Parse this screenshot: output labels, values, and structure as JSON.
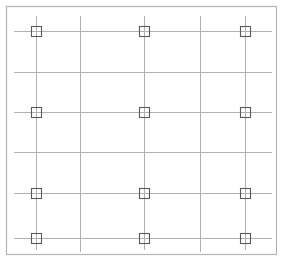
{
  "drawing": {
    "title": "Structural Column Grid Plan",
    "width": 283,
    "height": 264,
    "background_color": "#ffffff",
    "frame": {
      "name": "outer-frame",
      "x": 6,
      "y": 6,
      "width": 270,
      "height": 248,
      "stroke_color": "#b4b4b4",
      "stroke_width": 1.2
    },
    "grid": {
      "line_color": "#b0b0b0",
      "line_width": 1,
      "vertical_lines": [
        {
          "id": "grid-line-A",
          "x": 36,
          "y1": 16,
          "y2": 250,
          "has_markers": true
        },
        {
          "id": "grid-line-B",
          "x": 80,
          "y1": 16,
          "y2": 252,
          "has_markers": false
        },
        {
          "id": "grid-line-C",
          "x": 144,
          "y1": 16,
          "y2": 250,
          "has_markers": true
        },
        {
          "id": "grid-line-D",
          "x": 200,
          "y1": 16,
          "y2": 252,
          "has_markers": false
        },
        {
          "id": "grid-line-E",
          "x": 245,
          "y1": 16,
          "y2": 250,
          "has_markers": true
        }
      ],
      "horizontal_lines": [
        {
          "id": "grid-line-1",
          "y": 31,
          "x1": 14,
          "x2": 272,
          "has_markers": true
        },
        {
          "id": "grid-line-2",
          "y": 72,
          "x1": 14,
          "x2": 272,
          "has_markers": false
        },
        {
          "id": "grid-line-3",
          "y": 112,
          "x1": 14,
          "x2": 272,
          "has_markers": true
        },
        {
          "id": "grid-line-4",
          "y": 152,
          "x1": 14,
          "x2": 272,
          "has_markers": false
        },
        {
          "id": "grid-line-5",
          "y": 193,
          "x1": 14,
          "x2": 272,
          "has_markers": true
        },
        {
          "id": "grid-line-6",
          "y": 238,
          "x1": 14,
          "x2": 272,
          "has_markers": true
        }
      ]
    },
    "markers": {
      "symbol": "square-column-marker",
      "size": 10,
      "stroke_color": "#5a5a5a",
      "stroke_width": 1.1,
      "fill": "none",
      "count": 12,
      "positions": [
        {
          "id": "column-A1",
          "x": 36,
          "y": 31
        },
        {
          "id": "column-C1",
          "x": 144,
          "y": 31
        },
        {
          "id": "column-E1",
          "x": 245,
          "y": 31
        },
        {
          "id": "column-A3",
          "x": 36,
          "y": 112
        },
        {
          "id": "column-C3",
          "x": 144,
          "y": 112
        },
        {
          "id": "column-E3",
          "x": 245,
          "y": 112
        },
        {
          "id": "column-A5",
          "x": 36,
          "y": 193
        },
        {
          "id": "column-C5",
          "x": 144,
          "y": 193
        },
        {
          "id": "column-E5",
          "x": 245,
          "y": 193
        },
        {
          "id": "column-A6",
          "x": 36,
          "y": 238
        },
        {
          "id": "column-C6",
          "x": 144,
          "y": 238
        },
        {
          "id": "column-E6",
          "x": 245,
          "y": 238
        }
      ]
    }
  }
}
